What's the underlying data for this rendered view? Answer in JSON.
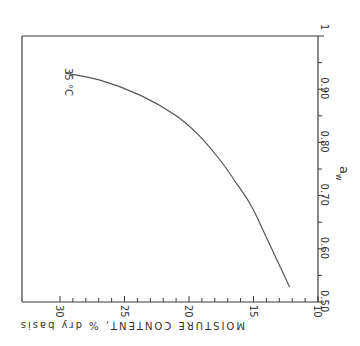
{
  "chart_data": {
    "type": "line",
    "orientation_note": "figure rotated 90 degrees clockwise",
    "title": "",
    "xlabel": "MOISTURE CONTENT, % dry basis",
    "ylabel": "a_w",
    "x_axis": {
      "label": "MOISTURE CONTENT, % dry basis",
      "range": [
        10,
        30
      ],
      "ticks": [
        30,
        25,
        20,
        15,
        10
      ],
      "tick_labels": [
        "30",
        "25",
        "20",
        "15",
        "10"
      ],
      "minor_step": 1
    },
    "y_axis": {
      "label": "a_w",
      "range": [
        0.5,
        1.0
      ],
      "ticks": [
        0.5,
        0.6,
        0.7,
        0.8,
        0.9,
        1.0
      ],
      "tick_labels": [
        "0.50",
        "0.60",
        "0.70",
        "0.80",
        "0.90",
        "1"
      ],
      "minor_step": 0.05
    },
    "grid": false,
    "legend": "none",
    "annotations": [
      "35 °C"
    ],
    "series": [
      {
        "name": "35 °C",
        "x": [
          12.2,
          13.2,
          14.2,
          15.2,
          16.4,
          17.6,
          19.3,
          21.1,
          23.8,
          26.9,
          29.6
        ],
        "y": [
          0.528,
          0.58,
          0.632,
          0.682,
          0.726,
          0.767,
          0.815,
          0.852,
          0.889,
          0.917,
          0.93
        ]
      }
    ]
  },
  "labels": {
    "x_axis_title": "MOISTURE CONTENT, % dry basis",
    "y_axis_title": "a",
    "y_axis_sub": "w",
    "curve_label": "35 °C",
    "x_ticks": [
      "30",
      "25",
      "20",
      "15",
      "10"
    ],
    "y_ticks": [
      "0.50",
      "0.60",
      "0.70",
      "0.80",
      "0.90",
      "1"
    ]
  }
}
